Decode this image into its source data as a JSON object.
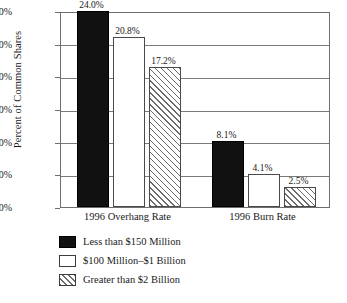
{
  "chart_data": {
    "type": "bar",
    "title": "",
    "xlabel": "",
    "ylabel": "Percent of Common Shares",
    "categories": [
      "1996 Overhang Rate",
      "1996 Burn Rate"
    ],
    "series": [
      {
        "name": "Less than $150 Million",
        "values": [
          24.0,
          8.1
        ],
        "labels": [
          "24.0%",
          "8.1%"
        ],
        "style": "solid-black"
      },
      {
        "name": "$100 Million–$1 Billion",
        "values": [
          20.8,
          4.1
        ],
        "labels": [
          "20.8%",
          "4.1%"
        ],
        "style": "white"
      },
      {
        "name": "Greater than $2 Billion",
        "values": [
          17.2,
          2.5
        ],
        "labels": [
          "17.2%",
          "2.5%"
        ],
        "style": "diagonal-hatch"
      }
    ],
    "ylim": [
      0.0,
      24.0
    ],
    "ytick_step": 4.0,
    "ytick_labels": [
      "0.0%",
      "4.0%",
      "8.0%",
      "12.0%",
      "16.0%",
      "20.0%",
      "24.0%"
    ],
    "ytick_values": [
      0.0,
      4.0,
      8.0,
      12.0,
      16.0,
      20.0,
      24.0
    ],
    "grid": true,
    "grid_axis": "y",
    "legend_position": "bottom-left",
    "legend_group_label": "Company Size",
    "colors": {
      "series_0": "#111111",
      "series_1": "#ffffff",
      "series_2_hatch": "#6b6b6b",
      "axis": "#6e6e6e",
      "gridline": "#7a7a7a",
      "text": "#1a1a1a"
    }
  },
  "axis": {
    "y_title": "Percent of Common Shares"
  },
  "legend": {
    "brace_glyph": "}",
    "group_label": "Company Size"
  }
}
